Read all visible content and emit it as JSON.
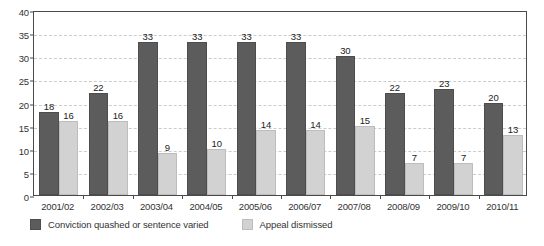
{
  "chart_data": {
    "type": "bar",
    "title": "",
    "subtitle": "",
    "xlabel": "",
    "ylabel": "",
    "ylim": [
      0,
      40
    ],
    "yticks": [
      0,
      5,
      10,
      15,
      20,
      25,
      30,
      35,
      40
    ],
    "grid": true,
    "grid_style": "dashed-horizontal",
    "legend_position": "bottom-left",
    "categories": [
      "2001/02",
      "2002/03",
      "2003/04",
      "2004/05",
      "2005/06",
      "2006/07",
      "2007/08",
      "2008/09",
      "2009/10",
      "2010/11"
    ],
    "series": [
      {
        "name": "Conviction quashed or sentence varied",
        "color": "#5c5c5c",
        "values": [
          18,
          22,
          33,
          33,
          33,
          33,
          30,
          22,
          23,
          20
        ]
      },
      {
        "name": "Appeal dismissed",
        "color": "#d2d2d2",
        "values": [
          16,
          16,
          9,
          10,
          14,
          14,
          15,
          7,
          7,
          13
        ]
      }
    ]
  },
  "axis": {
    "y_tick_labels": [
      "0",
      "5",
      "10",
      "15",
      "20",
      "25",
      "30",
      "35",
      "40"
    ]
  },
  "legend": {
    "items": [
      {
        "label": "Conviction quashed or sentence varied",
        "color": "#5c5c5c"
      },
      {
        "label": "Appeal dismissed",
        "color": "#d2d2d2"
      }
    ]
  },
  "colors": {
    "series_dark": "#5c5c5c",
    "series_light": "#d2d2d2",
    "axis": "#4a4a4a",
    "grid": "#cccccc",
    "text": "#333333",
    "background": "#ffffff"
  }
}
